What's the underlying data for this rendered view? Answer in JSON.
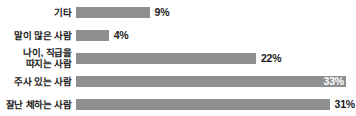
{
  "chart_data": {
    "type": "bar",
    "orientation": "horizontal",
    "title": "",
    "subtitle": "",
    "xlabel": "",
    "ylabel": "",
    "grid": false,
    "legend": false,
    "axis_visible": false,
    "xlim": [
      0,
      35
    ],
    "unit": "%",
    "bar_color": "#8f8f8f",
    "label_color": "#1a1a1a",
    "background": "#ffffff",
    "categories": [
      "기타",
      "말이 많은 사람",
      "나이, 직급을\n따지는 사람",
      "주사 있는 사람",
      "잘난 체하는 사람"
    ],
    "values": [
      9,
      4,
      22,
      33,
      31
    ],
    "value_labels": [
      "9%",
      "4%",
      "22%",
      "33%",
      "31%"
    ],
    "label_placement": [
      "outside",
      "outside",
      "outside",
      "inside-end",
      "outside"
    ]
  }
}
